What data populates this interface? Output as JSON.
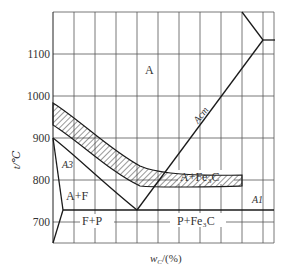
{
  "diagram": {
    "type": "phase-diagram",
    "y_axis": {
      "label": "t/℃",
      "ticks": [
        "1100",
        "1000",
        "900",
        "800",
        "700"
      ],
      "tick_values": [
        1100,
        1000,
        900,
        800,
        700
      ]
    },
    "x_axis": {
      "label": "wC/(%)",
      "label_main": "w",
      "label_sub": "C",
      "label_rest": "/(%)"
    },
    "regions": {
      "austenite": "A",
      "austenite_ferrite": "A+F",
      "austenite_cementite": "A+Fe₃C",
      "ferrite_pearlite": "F+P",
      "pearlite_cementite": "P+Fe₃C"
    },
    "lines": {
      "acm": "Acm",
      "a3": "A3",
      "a1": "A1"
    },
    "colors": {
      "line": "#1a1a1a",
      "grid": "#333333",
      "text": "#333333",
      "background": "#ffffff"
    }
  }
}
